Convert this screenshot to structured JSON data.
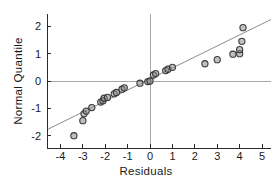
{
  "chart_data": {
    "type": "scatter",
    "title": "",
    "subtitle": "",
    "xlabel": "Residuals",
    "ylabel": "Normal Quantile",
    "xlim": [
      -4.6,
      5.4
    ],
    "ylim": [
      -2.45,
      2.45
    ],
    "xticks": [
      -4,
      -3,
      -2,
      -1,
      0,
      1,
      2,
      3,
      4,
      5
    ],
    "xtick_labels": [
      "-4",
      "-3",
      "-2",
      "-1",
      "0",
      "1",
      "2",
      "3",
      "4",
      "5"
    ],
    "yticks": [
      -2,
      -1,
      0,
      1,
      2
    ],
    "ytick_labels": [
      "-2",
      "-1",
      "0",
      "1",
      "2"
    ],
    "grid": false,
    "legend": "none",
    "reference_lines": {
      "horizontal_at_y": 0,
      "vertical_at_x": 0,
      "color": "#a8a8a8"
    },
    "fit_line": {
      "type": "normal-quantile-reference",
      "x_start": -4.6,
      "y_start": -1.78,
      "x_end": 5.4,
      "y_end": 2.25,
      "color": "#8d8d8d"
    },
    "marker": {
      "shape": "circle",
      "radius": 3.1,
      "fill": "#8a8a8a",
      "fill_opacity": 0.55,
      "stroke": "#3a3a3a"
    },
    "x": [
      -3.4,
      -3.0,
      -2.95,
      -2.85,
      -2.6,
      -2.2,
      -2.1,
      -2.05,
      -1.9,
      -1.6,
      -1.5,
      -1.25,
      -1.15,
      -0.45,
      -0.1,
      0.0,
      0.15,
      0.25,
      0.7,
      0.8,
      1.0,
      2.45,
      3.0,
      3.7,
      4.0,
      4.0,
      4.1
    ],
    "y": [
      -2.0,
      -1.45,
      -1.2,
      -1.1,
      -0.97,
      -0.77,
      -0.72,
      -0.63,
      -0.6,
      -0.47,
      -0.42,
      -0.3,
      -0.25,
      -0.08,
      -0.02,
      0.0,
      0.22,
      0.27,
      0.38,
      0.43,
      0.5,
      0.63,
      0.78,
      0.98,
      1.0,
      1.15,
      1.45
    ],
    "series": [
      {
        "name": "residual-quantiles",
        "points": [
          [
            -3.4,
            -2.0
          ],
          [
            -3.0,
            -1.45
          ],
          [
            -2.95,
            -1.2
          ],
          [
            -2.85,
            -1.1
          ],
          [
            -2.6,
            -0.97
          ],
          [
            -2.2,
            -0.77
          ],
          [
            -2.1,
            -0.72
          ],
          [
            -2.05,
            -0.63
          ],
          [
            -1.9,
            -0.6
          ],
          [
            -1.6,
            -0.47
          ],
          [
            -1.5,
            -0.42
          ],
          [
            -1.25,
            -0.3
          ],
          [
            -1.15,
            -0.25
          ],
          [
            -0.45,
            -0.08
          ],
          [
            -0.1,
            -0.02
          ],
          [
            0.0,
            0.0
          ],
          [
            0.15,
            0.22
          ],
          [
            0.25,
            0.27
          ],
          [
            0.7,
            0.38
          ],
          [
            0.8,
            0.43
          ],
          [
            1.0,
            0.5
          ],
          [
            2.45,
            0.63
          ],
          [
            3.0,
            0.78
          ],
          [
            3.7,
            0.98
          ],
          [
            4.0,
            1.0
          ],
          [
            4.0,
            1.15
          ],
          [
            4.1,
            1.45
          ],
          [
            4.15,
            1.95
          ]
        ]
      }
    ],
    "annotations": []
  }
}
